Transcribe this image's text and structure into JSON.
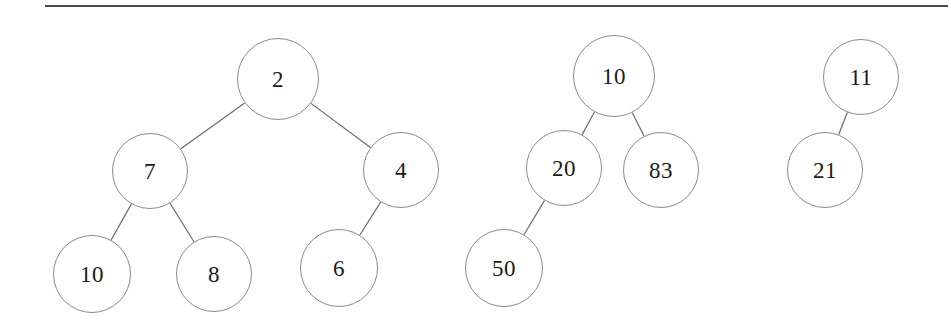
{
  "page": {
    "background": "#fefefe",
    "width": 948,
    "height": 336,
    "rule": {
      "name": "top-horizontal-rule",
      "x": 45,
      "y": 5,
      "width": 903,
      "color": "#4a4a4a"
    }
  },
  "style": {
    "node_stroke": "#8a8a8a",
    "node_fill": "#ffffff",
    "edge_stroke": "#6b6b6b",
    "edge_width": 1.2,
    "text_color": "#1a1a1a"
  },
  "diagram": {
    "type": "binary-trees",
    "tree_count": 3,
    "trees": [
      {
        "id": "tree-1",
        "root": "2",
        "nodes": [
          {
            "id": "t1-n2",
            "label": "2",
            "cx": 278,
            "cy": 79,
            "r": 41
          },
          {
            "id": "t1-n7",
            "label": "7",
            "cx": 150,
            "cy": 171,
            "r": 38
          },
          {
            "id": "t1-n4",
            "label": "4",
            "cx": 401,
            "cy": 170,
            "r": 38
          },
          {
            "id": "t1-n10",
            "label": "10",
            "cx": 92,
            "cy": 274,
            "r": 39
          },
          {
            "id": "t1-n8",
            "label": "8",
            "cx": 214,
            "cy": 274,
            "r": 38
          },
          {
            "id": "t1-n6",
            "label": "6",
            "cx": 339,
            "cy": 268,
            "r": 39
          }
        ],
        "edges": [
          {
            "from": "t1-n2",
            "to": "t1-n7"
          },
          {
            "from": "t1-n2",
            "to": "t1-n4"
          },
          {
            "from": "t1-n7",
            "to": "t1-n10"
          },
          {
            "from": "t1-n7",
            "to": "t1-n8"
          },
          {
            "from": "t1-n4",
            "to": "t1-n6"
          }
        ]
      },
      {
        "id": "tree-2",
        "root": "10",
        "nodes": [
          {
            "id": "t2-n10",
            "label": "10",
            "cx": 614,
            "cy": 76,
            "r": 41
          },
          {
            "id": "t2-n20",
            "label": "20",
            "cx": 564,
            "cy": 168,
            "r": 38
          },
          {
            "id": "t2-n83",
            "label": "83",
            "cx": 661,
            "cy": 170,
            "r": 38
          },
          {
            "id": "t2-n50",
            "label": "50",
            "cx": 504,
            "cy": 268,
            "r": 39
          }
        ],
        "edges": [
          {
            "from": "t2-n10",
            "to": "t2-n20"
          },
          {
            "from": "t2-n10",
            "to": "t2-n83"
          },
          {
            "from": "t2-n20",
            "to": "t2-n50"
          }
        ]
      },
      {
        "id": "tree-3",
        "root": "11",
        "nodes": [
          {
            "id": "t3-n11",
            "label": "11",
            "cx": 861,
            "cy": 77,
            "r": 38
          },
          {
            "id": "t3-n21",
            "label": "21",
            "cx": 825,
            "cy": 170,
            "r": 38
          }
        ],
        "edges": [
          {
            "from": "t3-n11",
            "to": "t3-n21"
          }
        ]
      }
    ]
  }
}
